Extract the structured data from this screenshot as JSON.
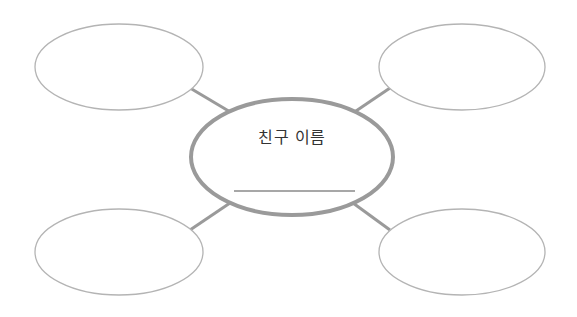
{
  "diagram": {
    "type": "mind-map",
    "center": {
      "label": "친구 이름",
      "blank_line": true
    },
    "branches": [
      {
        "position": "top-left",
        "label": ""
      },
      {
        "position": "top-right",
        "label": ""
      },
      {
        "position": "bottom-left",
        "label": ""
      },
      {
        "position": "bottom-right",
        "label": ""
      }
    ],
    "colors": {
      "center_stroke": "#9a9a9a",
      "branch_stroke": "#b4b4b4",
      "connector": "#9a9a9a",
      "underline": "#8a8a8a",
      "text": "#333333"
    }
  }
}
